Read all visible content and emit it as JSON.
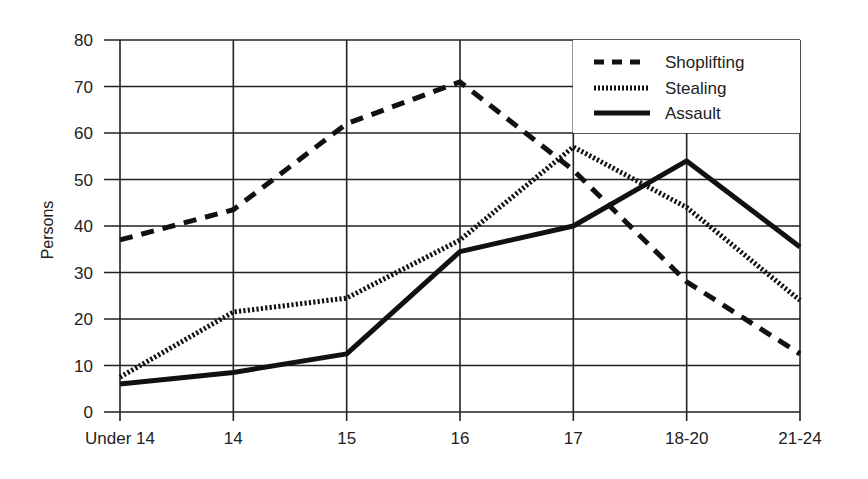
{
  "chart_data": {
    "type": "line",
    "title": "",
    "xlabel": "",
    "ylabel": "Persons",
    "ylim": [
      0,
      80
    ],
    "yticks": [
      0,
      10,
      20,
      30,
      40,
      50,
      60,
      70,
      80
    ],
    "categories": [
      "Under 14",
      "14",
      "15",
      "16",
      "17",
      "18-20",
      "21-24"
    ],
    "grid": true,
    "legend_position": "upper right",
    "series": [
      {
        "name": "Shoplifting",
        "style": "dashed",
        "values": [
          37,
          43.5,
          62,
          71,
          52,
          28,
          12.5
        ]
      },
      {
        "name": "Stealing",
        "style": "dotted",
        "values": [
          7.5,
          21.5,
          24.5,
          37,
          57,
          44,
          24
        ]
      },
      {
        "name": "Assault",
        "style": "solid",
        "values": [
          6,
          8.5,
          12.5,
          34.5,
          40,
          54,
          35.5
        ]
      }
    ]
  },
  "legend": {
    "items": [
      {
        "label": "Shoplifting"
      },
      {
        "label": "Stealing"
      },
      {
        "label": "Assault"
      }
    ]
  },
  "colors": {
    "line": "#111111",
    "grid": "#222222",
    "text": "#222222"
  }
}
